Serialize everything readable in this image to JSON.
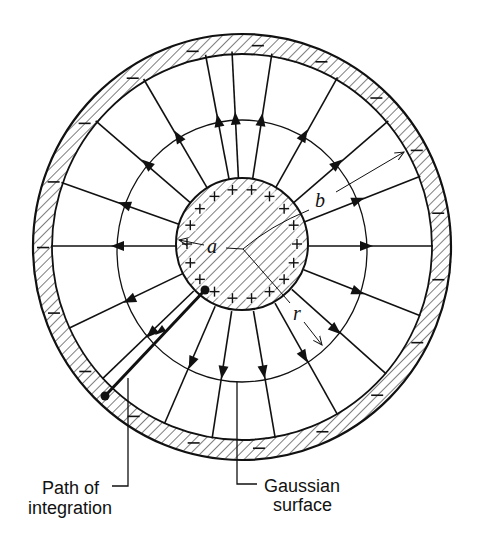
{
  "figure": {
    "colors": {
      "ink": "#111111",
      "background": "#ffffff"
    },
    "center": [
      242,
      247
    ],
    "inner_conductor": {
      "radius": 66,
      "charge_sign": "+",
      "charge_count": 18,
      "hatched": true
    },
    "outer_shell": {
      "inner_radius": 190,
      "outer_radius": 210,
      "charge_sign": "−",
      "charge_count": 19,
      "hatched": true
    },
    "gaussian_surface": {
      "rx": 125,
      "ry": 131
    },
    "field_line_angles_deg": [
      -93,
      -81,
      -60,
      -40,
      -21,
      0,
      21,
      41,
      60,
      80,
      99,
      114,
      137,
      155,
      180,
      199,
      220,
      239,
      259
    ],
    "labels": {
      "a": "a",
      "b": "b",
      "r": "r",
      "path_line1": "Path of",
      "path_line2": "integration",
      "gaussian_line1": "Gaussian",
      "gaussian_line2": "surface"
    }
  }
}
